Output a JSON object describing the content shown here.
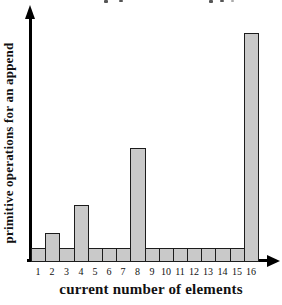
{
  "chart_data": {
    "type": "bar",
    "title": "",
    "xlabel": "current number of elements",
    "ylabel": "primitive operations for an append",
    "categories": [
      "1",
      "2",
      "3",
      "4",
      "5",
      "6",
      "7",
      "8",
      "9",
      "10",
      "11",
      "12",
      "13",
      "14",
      "15",
      "16"
    ],
    "values": [
      1,
      2,
      1,
      4,
      1,
      1,
      1,
      8,
      1,
      1,
      1,
      1,
      1,
      1,
      1,
      16
    ],
    "ylim": [
      0,
      17
    ],
    "grid": false,
    "legend": "none",
    "axis_arrows": true,
    "colors": {
      "background": "#ffffff",
      "bar_fill": "#c9c9c9",
      "bar_border": "#1c1c1c",
      "axis": "#000000",
      "text": "#111111"
    }
  }
}
